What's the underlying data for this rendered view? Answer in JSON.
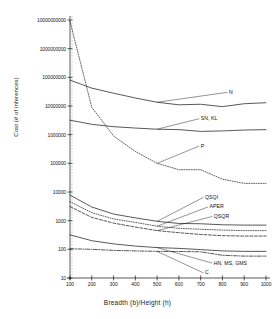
{
  "chart_data": {
    "type": "line",
    "title": "",
    "xlabel": "Breadth (b)/Height (h)",
    "ylabel": "Cost (# of inferences)",
    "xlim": [
      100,
      1000
    ],
    "ylim": [
      10,
      10000000000
    ],
    "yscale": "log",
    "grid": false,
    "legend_position": "inline-annotations",
    "xticks": [
      100,
      200,
      300,
      400,
      500,
      600,
      700,
      800,
      900,
      1000
    ],
    "xtick_labels": [
      "100",
      "200",
      "300",
      "400",
      "500",
      "600",
      "700",
      "800",
      "900",
      "1000"
    ],
    "yticks": [
      10,
      100,
      1000,
      10000,
      100000,
      1000000,
      10000000,
      100000000,
      1000000000,
      10000000000
    ],
    "ytick_labels": [
      "10",
      "100",
      "1000",
      "10000",
      "100000",
      "1000000",
      "10000000",
      "100000000",
      "1000000000",
      "10000000000"
    ],
    "x": [
      100,
      200,
      300,
      400,
      500,
      600,
      700,
      800,
      900,
      1000
    ],
    "series": [
      {
        "name": "N",
        "label": "N",
        "style": "solid",
        "values": [
          80000000,
          42000000,
          28000000,
          19000000,
          13500000,
          11000000,
          11500000,
          9500000,
          12000000,
          13000000
        ]
      },
      {
        "name": "SN, KL",
        "label": "SN, KL",
        "style": "solid",
        "values": [
          3200000,
          2300000,
          1900000,
          1700000,
          1550000,
          1500000,
          1300000,
          1350000,
          1450000,
          1500000
        ]
      },
      {
        "name": "P",
        "label": "P",
        "style": "dotted",
        "values": [
          9000000000,
          9000000,
          900000,
          260000,
          100000,
          60000,
          60000,
          28000,
          20000,
          20000
        ]
      },
      {
        "name": "QSQI",
        "label": "QSQI",
        "style": "solid",
        "values": [
          7800,
          3000,
          1700,
          1250,
          950,
          800,
          780,
          720,
          700,
          700
        ]
      },
      {
        "name": "APER",
        "label": "APER",
        "style": "dotted",
        "values": [
          4600,
          1900,
          1150,
          870,
          640,
          540,
          500,
          470,
          450,
          450
        ]
      },
      {
        "name": "QSQR",
        "label": "QSQR",
        "style": "dashed",
        "values": [
          3100,
          1300,
          820,
          600,
          450,
          380,
          330,
          300,
          290,
          290
        ]
      },
      {
        "name": "HN, MS, GMS",
        "label": "HN, MS, GMS",
        "style": "solid",
        "values": [
          320,
          200,
          155,
          130,
          115,
          108,
          98,
          88,
          85,
          85
        ]
      },
      {
        "name": "C",
        "label": "C",
        "style": "dashdot",
        "values": [
          105,
          100,
          92,
          88,
          85,
          84,
          82,
          62,
          58,
          58
        ]
      }
    ],
    "annotations": [
      {
        "text": "N",
        "x": 830,
        "y": 30000000
      },
      {
        "text": "SN, KL",
        "x": 700,
        "y": 3600000
      },
      {
        "text": "P",
        "x": 700,
        "y": 400000
      },
      {
        "text": "QSQI",
        "x": 720,
        "y": 6500
      },
      {
        "text": "APER",
        "x": 740,
        "y": 3000
      },
      {
        "text": "QSQR",
        "x": 760,
        "y": 1400
      },
      {
        "text": "HN, MS, GMS",
        "x": 760,
        "y": 33
      },
      {
        "text": "C",
        "x": 720,
        "y": 15
      }
    ]
  },
  "axis": {
    "y_label": "Cost (# of inferences)",
    "x_label": "Breadth (b)/Height (h)"
  }
}
